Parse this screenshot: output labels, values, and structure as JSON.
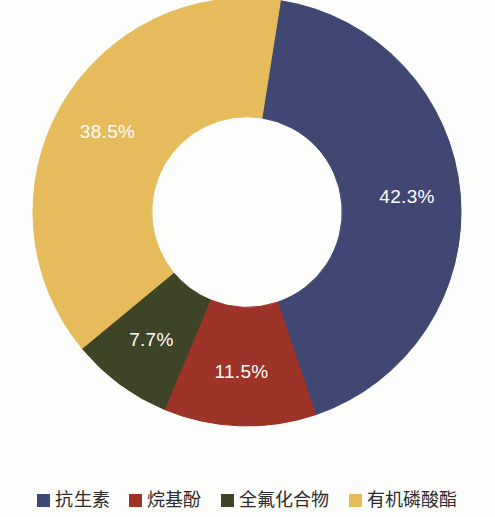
{
  "chart_data": {
    "type": "pie",
    "variant": "donut",
    "title": "",
    "subtitle": "",
    "xlabel": "",
    "ylabel": "",
    "grid": false,
    "legend_position": "bottom",
    "hole_ratio": 0.445,
    "start_angle_deg": 9,
    "direction": "clockwise",
    "categories": [
      "抗生素",
      "烷基酚",
      "全氟化合物",
      "有机磷酸酯"
    ],
    "values": [
      42.3,
      11.5,
      7.7,
      38.5
    ],
    "value_unit": "%",
    "colors": [
      "#3f4772",
      "#9e3328",
      "#3e4426",
      "#e5bb5b"
    ],
    "label_color": "#ffffff",
    "slices": [
      {
        "label": "抗生素",
        "value": 42.3,
        "display": "42.3%",
        "color": "#3f4772"
      },
      {
        "label": "烷基酚",
        "value": 11.5,
        "display": "11.5%",
        "color": "#9e3328"
      },
      {
        "label": "全氟化合物",
        "value": 7.7,
        "display": "7.7%",
        "color": "#3e4426"
      },
      {
        "label": "有机磷酸酯",
        "value": 38.5,
        "display": "38.5%",
        "color": "#e5bb5b"
      }
    ]
  },
  "legend": {
    "items": [
      {
        "label": "抗生素",
        "color": "#3f4772"
      },
      {
        "label": "烷基酚",
        "color": "#9e3328"
      },
      {
        "label": "全氟化合物",
        "color": "#3e4426"
      },
      {
        "label": "有机磷酸酯",
        "color": "#e5bb5b"
      }
    ]
  },
  "background": "#fdfdfb"
}
